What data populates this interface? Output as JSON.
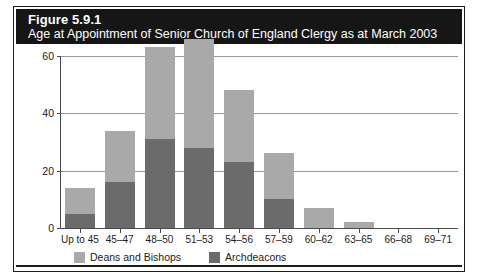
{
  "figure": {
    "title": "Figure 5.9.1",
    "subtitle": "Age at Appointment of Senior Church of England Clergy as at March 2003"
  },
  "colors": {
    "header_background": "#161616",
    "header_text": "#ffffff",
    "deans_and_bishops": "#a9a9a9",
    "archdeacons": "#6b6b6b",
    "axis": "#4a4a4a",
    "gridline": "#9a9a9a",
    "frame": "#1b1b1b"
  },
  "chart_data": {
    "type": "bar",
    "stacked": true,
    "title": "Age at Appointment of Senior Church of England Clergy as at March 2003",
    "xlabel": "",
    "ylabel": "",
    "ylim": [
      0,
      60
    ],
    "yticks": [
      0,
      20,
      40,
      60
    ],
    "ytick_labels": [
      "0",
      "20",
      "40",
      "60"
    ],
    "grid": true,
    "legend_position": "bottom-left",
    "categories": [
      "Up to 45",
      "45–47",
      "48–50",
      "51–53",
      "54–56",
      "57–59",
      "60–62",
      "63–65",
      "66–68",
      "69–71"
    ],
    "series": [
      {
        "name": "Archdeacons",
        "color": "#6b6b6b",
        "values": [
          5,
          16,
          31,
          28,
          23,
          10,
          0,
          0,
          0,
          0
        ]
      },
      {
        "name": "Deans and Bishops",
        "color": "#a9a9a9",
        "values": [
          9,
          18,
          32,
          38,
          25,
          16,
          7,
          2,
          0,
          0
        ]
      }
    ],
    "totals": [
      14,
      34,
      63,
      66,
      48,
      26,
      7,
      2,
      0,
      0
    ]
  },
  "legend": {
    "items": [
      {
        "label": "Deans and Bishops",
        "color": "#a9a9a9"
      },
      {
        "label": "Archdeacons",
        "color": "#6b6b6b"
      }
    ]
  }
}
